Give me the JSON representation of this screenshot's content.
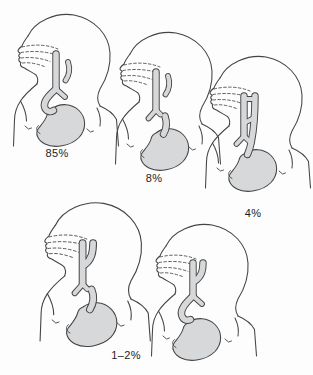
{
  "diagram": {
    "colors": {
      "line": "#444444",
      "anatomy-fill": "#d7d8da",
      "bg": "#fdfdfd",
      "label": "#1c1c1c"
    },
    "figures": [
      {
        "name": "infant-esophageal-atresia-distal-fistula",
        "label": "85%"
      },
      {
        "name": "infant-esophageal-atresia-no-fistula",
        "label": "8%"
      },
      {
        "name": "infant-h-type-fistula",
        "label": "4%"
      },
      {
        "name": "infant-esophageal-atresia-proximal-fistula",
        "label": "1–2%"
      },
      {
        "name": "infant-esophageal-atresia-double-fistula",
        "label": ""
      }
    ]
  }
}
